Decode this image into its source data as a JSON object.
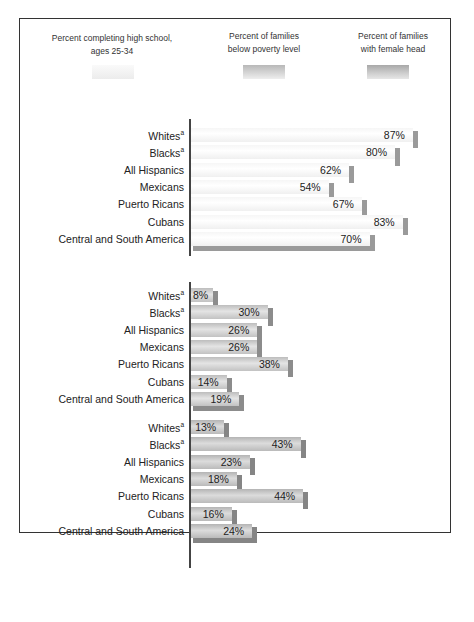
{
  "legend": [
    {
      "label_line1": "Percent completing high school,",
      "label_line2": "ages 25-34",
      "color": "#f2f2f2"
    },
    {
      "label_line1": "Percent of families",
      "label_line2": "below poverty level",
      "color": "#c6c6c6"
    },
    {
      "label_line1": "Percent of families",
      "label_line2": "with female head",
      "color": "#b6b6b6"
    }
  ],
  "groups": [
    {
      "name": "Percent completing high school, ages 25-34",
      "rows": [
        {
          "label": "Whites",
          "sup": "a",
          "value": 87,
          "text": "87%"
        },
        {
          "label": "Blacks",
          "sup": "a",
          "value": 80,
          "text": "80%"
        },
        {
          "label": "All Hispanics",
          "sup": "",
          "value": 62,
          "text": "62%"
        },
        {
          "label": "Mexicans",
          "sup": "",
          "value": 54,
          "text": "54%"
        },
        {
          "label": "Puerto Ricans",
          "sup": "",
          "value": 67,
          "text": "67%"
        },
        {
          "label": "Cubans",
          "sup": "",
          "value": 83,
          "text": "83%"
        },
        {
          "label": "Central and South America",
          "sup": "",
          "value": 70,
          "text": "70%"
        }
      ]
    },
    {
      "name": "Percent of families below poverty level",
      "rows": [
        {
          "label": "Whites",
          "sup": "a",
          "value": 8,
          "text": "8%"
        },
        {
          "label": "Blacks",
          "sup": "a",
          "value": 30,
          "text": "30%"
        },
        {
          "label": "All Hispanics",
          "sup": "",
          "value": 26,
          "text": "26%"
        },
        {
          "label": "Mexicans",
          "sup": "",
          "value": 26,
          "text": "26%"
        },
        {
          "label": "Puerto Ricans",
          "sup": "",
          "value": 38,
          "text": "38%"
        },
        {
          "label": "Cubans",
          "sup": "",
          "value": 14,
          "text": "14%"
        },
        {
          "label": "Central and South America",
          "sup": "",
          "value": 19,
          "text": "19%"
        }
      ]
    },
    {
      "name": "Percent of families with female head",
      "rows": [
        {
          "label": "Whites",
          "sup": "a",
          "value": 13,
          "text": "13%"
        },
        {
          "label": "Blacks",
          "sup": "a",
          "value": 43,
          "text": "43%"
        },
        {
          "label": "All Hispanics",
          "sup": "",
          "value": 23,
          "text": "23%"
        },
        {
          "label": "Mexicans",
          "sup": "",
          "value": 18,
          "text": "18%"
        },
        {
          "label": "Puerto Ricans",
          "sup": "",
          "value": 44,
          "text": "44%"
        },
        {
          "label": "Cubans",
          "sup": "",
          "value": 16,
          "text": "16%"
        },
        {
          "label": "Central and South America",
          "sup": "",
          "value": 24,
          "text": "24%"
        }
      ]
    }
  ],
  "chart_data": {
    "type": "bar",
    "orientation": "horizontal",
    "title": "",
    "xlabel": "Percent",
    "ylabel": "",
    "grid": false,
    "legend_position": "top",
    "categories": [
      "Whites",
      "Blacks",
      "All Hispanics",
      "Mexicans",
      "Puerto Ricans",
      "Cubans",
      "Central and South America"
    ],
    "series": [
      {
        "name": "Percent completing high school, ages 25-34",
        "values": [
          87,
          80,
          62,
          54,
          67,
          83,
          70
        ]
      },
      {
        "name": "Percent of families below poverty level",
        "values": [
          8,
          30,
          26,
          26,
          38,
          14,
          19
        ]
      },
      {
        "name": "Percent of families with female head",
        "values": [
          13,
          43,
          23,
          18,
          44,
          16,
          24
        ]
      }
    ],
    "annotations": [
      "Superscript 'a' on Whites and Blacks"
    ],
    "xlim": [
      0,
      100
    ]
  }
}
